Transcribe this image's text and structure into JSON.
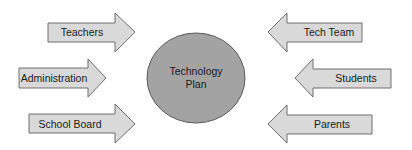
{
  "diagram": {
    "center": {
      "line1": "Technology",
      "line2": "Plan",
      "fill": "#a3a3a3"
    },
    "left_inputs": [
      {
        "label": "Teachers"
      },
      {
        "label": "Administration"
      },
      {
        "label": "School Board"
      }
    ],
    "right_inputs": [
      {
        "label": "Tech Team"
      },
      {
        "label": "Students"
      },
      {
        "label": "Parents"
      }
    ],
    "arrow_fill": "#d9d9d9"
  }
}
